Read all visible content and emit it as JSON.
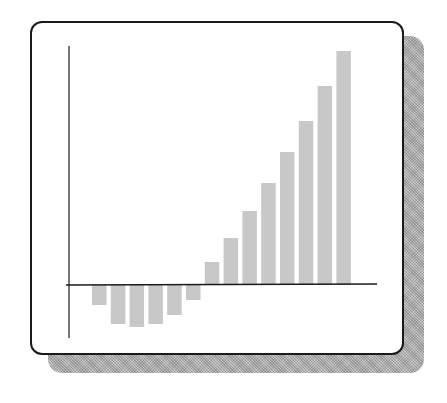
{
  "chart_data": {
    "type": "bar",
    "title": "",
    "xlabel": "",
    "ylabel": "",
    "categories": [
      "1",
      "2",
      "3",
      "4",
      "5",
      "6",
      "7",
      "8",
      "9",
      "10",
      "11",
      "12",
      "13",
      "14"
    ],
    "values": [
      -20,
      -39,
      -42,
      -39,
      -30,
      -15,
      23,
      47,
      74,
      102,
      133,
      164,
      199,
      234
    ],
    "ylim": [
      -53,
      239
    ],
    "grid": false,
    "legend": "none",
    "tick_labels": "none",
    "bar_color": "#c8c8c8",
    "axis_color": "#1a1a1a"
  },
  "frame": {
    "border_color": "#1a1a1a",
    "shadow_color": "#b4b4b4",
    "background": "#ffffff"
  }
}
